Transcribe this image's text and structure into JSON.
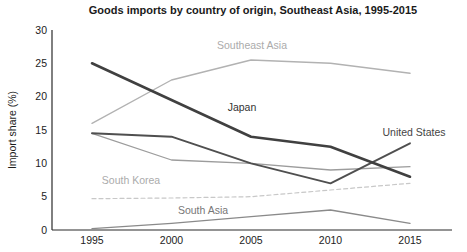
{
  "chart_data": {
    "type": "line",
    "title": "Goods imports by country of origin, Southeast Asia, 1995-2015",
    "xlabel": "",
    "ylabel": "Import share (%)",
    "x": [
      1995,
      2000,
      2005,
      2010,
      2015
    ],
    "ylim": [
      0,
      30
    ],
    "y_ticks": [
      0,
      5,
      10,
      15,
      20,
      25,
      30
    ],
    "grid": false,
    "legend": "inline-labels-on-plot",
    "series": [
      {
        "label": "Southeast Asia",
        "values": [
          16,
          22.5,
          25.5,
          25,
          23.5
        ],
        "color": "#b2b2b2",
        "label_color": "#ababab",
        "width": 1.4,
        "dash": null
      },
      {
        "label": "South Korea",
        "values": [
          4.7,
          4.8,
          5,
          6,
          7
        ],
        "color": "#c8c8c8",
        "label_color": "#ababab",
        "width": 1.2,
        "dash": "4 3"
      },
      {
        "label": "",
        "values": [
          14.5,
          10.5,
          10,
          9,
          9.5
        ],
        "color": "#9c9c9c",
        "label_color": null,
        "width": 1.3,
        "dash": null
      },
      {
        "label": "South Asia",
        "values": [
          0.2,
          1,
          2,
          3,
          1
        ],
        "color": "#8a8a8a",
        "label_color": "#777777",
        "width": 1.3,
        "dash": null
      },
      {
        "label": "United States",
        "values": [
          14.5,
          14,
          10,
          7,
          13
        ],
        "color": "#4f4f4f",
        "label_color": "#444444",
        "width": 1.9,
        "dash": null
      },
      {
        "label": "Japan",
        "values": [
          25,
          19.5,
          14,
          12.5,
          8
        ],
        "color": "#404040",
        "label_color": "#333333",
        "width": 2.6,
        "dash": null
      }
    ]
  },
  "colors": {
    "background": "#ffffff",
    "axis": "#2b2b2b",
    "tick_text": "#1c1c1c",
    "title_text": "#1a1a1a"
  }
}
